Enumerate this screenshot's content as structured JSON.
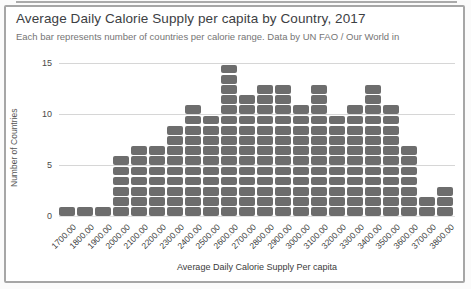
{
  "header": {
    "title": "Average Daily Calorie Supply per capita by Country, 2017",
    "subtitle": "Each bar represents number of countries per calorie range. Data by UN FAO / Our World in"
  },
  "chart_data": {
    "type": "bar",
    "style": "unit-stacked histogram (each bar built of unit squares)",
    "title": "Average Daily Calorie Supply per capita by Country, 2017",
    "subtitle": "Each bar represents number of countries per calorie range. Data by UN FAO / Our World in",
    "categories": [
      "1700.00",
      "1800.00",
      "1900.00",
      "2000.00",
      "2100.00",
      "2200.00",
      "2300.00",
      "2400.00",
      "2500.00",
      "2600.00",
      "2700.00",
      "2800.00",
      "2900.00",
      "3000.00",
      "3100.00",
      "3200.00",
      "3300.00",
      "3400.00",
      "3500.00",
      "3600.00",
      "3700.00",
      "3800.00"
    ],
    "values": [
      1,
      1,
      1,
      6,
      7,
      7,
      9,
      11,
      10,
      15,
      12,
      13,
      13,
      11,
      13,
      10,
      11,
      13,
      11,
      7,
      2,
      3
    ],
    "xlabel": "Average Daily Calorie Supply Per capita",
    "ylabel": "Number of Countries",
    "ylim": [
      0,
      15
    ],
    "yticks": [
      0,
      5,
      10,
      15
    ],
    "grid": true,
    "legend": "none",
    "bar_color": "#6d6d6d",
    "gridline_color": "#d6d6d6"
  }
}
